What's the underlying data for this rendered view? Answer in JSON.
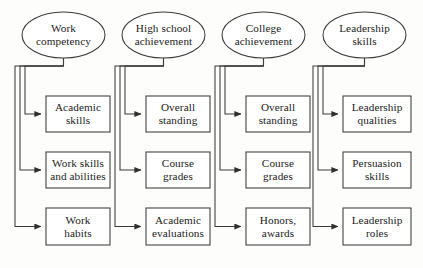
{
  "diagram": {
    "type": "hierarchical-flow-chart",
    "title": "",
    "orientation": "top-down, four parallel columns",
    "style": {
      "background": "#fdfdfb",
      "stroke": "#3b3b3b",
      "fill": "#ffffff",
      "text": "#1b1b1b"
    },
    "columns": [
      {
        "id": "col-1",
        "root": {
          "label": "Work\ncompetency",
          "line1": "Work",
          "line2": "competency",
          "shape": "ellipse"
        },
        "children": [
          {
            "label": "Academic skills",
            "line1": "Academic",
            "line2": "skills",
            "shape": "rect"
          },
          {
            "label": "Work skills and abilities",
            "line1": "Work skills",
            "line2": "and abilities",
            "shape": "rect"
          },
          {
            "label": "Work habits",
            "line1": "Work",
            "line2": "habits",
            "shape": "rect"
          }
        ]
      },
      {
        "id": "col-2",
        "root": {
          "label": "High school\nachievement",
          "line1": "High school",
          "line2": "achievement",
          "shape": "ellipse"
        },
        "children": [
          {
            "label": "Overall standing",
            "line1": "Overall",
            "line2": "standing",
            "shape": "rect"
          },
          {
            "label": "Course grades",
            "line1": "Course",
            "line2": "grades",
            "shape": "rect"
          },
          {
            "label": "Academic evaluations",
            "line1": "Academic",
            "line2": "evaluations",
            "shape": "rect"
          }
        ]
      },
      {
        "id": "col-3",
        "root": {
          "label": "College\nachievement",
          "line1": "College",
          "line2": "achievement",
          "shape": "ellipse"
        },
        "children": [
          {
            "label": "Overall standing",
            "line1": "Overall",
            "line2": "standing",
            "shape": "rect"
          },
          {
            "label": "Course grades",
            "line1": "Course",
            "line2": "grades",
            "shape": "rect"
          },
          {
            "label": "Honors, awards",
            "line1": "Honors,",
            "line2": "awards",
            "shape": "rect"
          }
        ]
      },
      {
        "id": "col-4",
        "root": {
          "label": "Leadership\nskills",
          "line1": "Leadership",
          "line2": "skills",
          "shape": "ellipse"
        },
        "children": [
          {
            "label": "Leadership qualities",
            "line1": "Leadership",
            "line2": "qualities",
            "shape": "rect"
          },
          {
            "label": "Persuasion skills",
            "line1": "Persuasion",
            "line2": "skills",
            "shape": "rect"
          },
          {
            "label": "Leadership roles",
            "line1": "Leadership",
            "line2": "roles",
            "shape": "rect"
          }
        ]
      }
    ]
  }
}
